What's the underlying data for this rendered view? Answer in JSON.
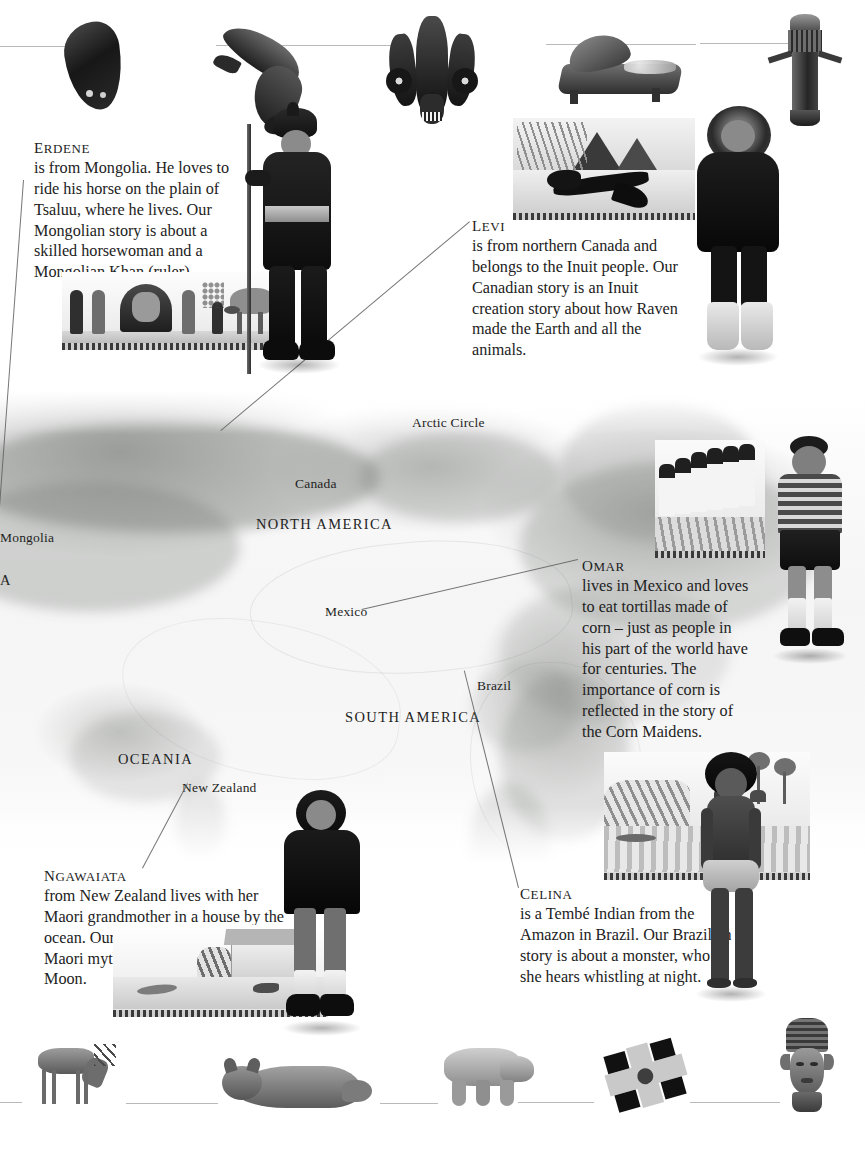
{
  "page": {
    "width": 865,
    "height": 1152,
    "background": "#ffffff",
    "ink": "#222222"
  },
  "map": {
    "name": "world-relief-map",
    "labels": [
      {
        "id": "arctic-circle",
        "text": "Arctic Circle",
        "type": "line",
        "x": 412,
        "y": 415
      },
      {
        "id": "canada",
        "text": "Canada",
        "type": "country",
        "x": 295,
        "y": 476
      },
      {
        "id": "north-america",
        "text": "NORTH AMERICA",
        "type": "region",
        "x": 256,
        "y": 516
      },
      {
        "id": "mongolia",
        "text": "Mongolia",
        "type": "country",
        "x": 0,
        "y": 530
      },
      {
        "id": "asia",
        "text": "A",
        "type": "region",
        "x": 0,
        "y": 572
      },
      {
        "id": "mexico",
        "text": "Mexico",
        "type": "country",
        "x": 325,
        "y": 604
      },
      {
        "id": "brazil",
        "text": "Brazil",
        "type": "country",
        "x": 477,
        "y": 678
      },
      {
        "id": "south-america",
        "text": "SOUTH AMERICA",
        "type": "region",
        "x": 345,
        "y": 709
      },
      {
        "id": "oceania",
        "text": "OCEANIA",
        "type": "region",
        "x": 118,
        "y": 751
      },
      {
        "id": "new-zealand",
        "text": "New Zealand",
        "type": "country",
        "x": 182,
        "y": 780
      }
    ]
  },
  "stories": [
    {
      "id": "erdene",
      "name": "Erdene",
      "body": "is from Mongolia. He loves to ride his horse on the plain of Tsaluu, where he lives. Our Mongolian story is about a skilled horsewoman and a Mongolian Khan (ruler).",
      "country": "Mongolia",
      "illustration": "mongolian-khan-scene",
      "photo": "boy-in-mongolian-deel-with-pole"
    },
    {
      "id": "levi",
      "name": "Levi",
      "body": "is from northern Canada and belongs to the Inuit people. Our Canadian story is an Inuit creation story about how Raven made the Earth and all the animals.",
      "country": "Canada",
      "illustration": "raven-arctic-scene",
      "photo": "boy-in-fur-trimmed-parka"
    },
    {
      "id": "omar",
      "name": "Omar",
      "body": "lives in Mexico and loves to eat tortillas made of corn – just as people in his part of the world have for centuries. The importance of corn is reflected in the story of the Corn Maidens.",
      "country": "Mexico",
      "illustration": "corn-maidens-scene",
      "photo": "boy-in-striped-polo-shirt"
    },
    {
      "id": "ngawaiata",
      "name": "Ngawaiata",
      "body": "from New Zealand lives with her Maori grandmother in a house by the ocean. Our New Zealand story is a Maori myth about the face on the Moon.",
      "country": "New Zealand",
      "illustration": "maori-seaside-house-scene",
      "photo": "girl-in-dark-hooded-sweatshirt"
    },
    {
      "id": "celina",
      "name": "Celina",
      "body": "is a Tembé Indian from the Amazon in Brazil. Our Brazilian story is about a monster, who she hears whistling at night.",
      "country": "Brazil",
      "illustration": "amazon-rainforest-scene",
      "photo": "girl-with-body-paint-and-wrap"
    }
  ],
  "artifacts_top": [
    {
      "id": "carved-fish",
      "label": "carved dark fish figure"
    },
    {
      "id": "carved-dolphin",
      "label": "carved leaping dolphin"
    },
    {
      "id": "ceremonial-mask",
      "label": "ornate ceremonial mask"
    },
    {
      "id": "grinding-stone",
      "label": "stone metate with corn"
    },
    {
      "id": "carved-drum",
      "label": "carved wooden drum"
    }
  ],
  "artifacts_bottom": [
    {
      "id": "caribou",
      "label": "grazing caribou"
    },
    {
      "id": "cat",
      "label": "long-haired cat lying down"
    },
    {
      "id": "polar-bear",
      "label": "walking polar bear"
    },
    {
      "id": "cross-ornament",
      "label": "dark cross-shaped ornament"
    },
    {
      "id": "bronze-head",
      "label": "carved bronze head sculpture"
    }
  ]
}
